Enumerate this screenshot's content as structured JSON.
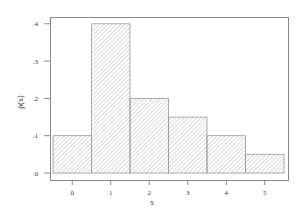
{
  "chart_data": {
    "type": "bar",
    "title": "",
    "xlabel": "x",
    "ylabel": "p(x)",
    "categories": [
      "0",
      "1",
      "2",
      "3",
      "4",
      "5"
    ],
    "values": [
      0.1,
      0.4,
      0.2,
      0.15,
      0.1,
      0.05
    ],
    "ylim": [
      0,
      0.43
    ],
    "yticks": [
      0,
      0.1,
      0.2,
      0.3,
      0.4
    ],
    "ytick_labels": [
      "0",
      ".1",
      ".2",
      ".3",
      ".4"
    ],
    "grid": false,
    "legend": null,
    "bar_style": "diagonal-hatch",
    "colors": {
      "frame": "#8a8a8a",
      "bar_edge": "#9a9a9a",
      "hatch": "#b5b5b5",
      "text": "#333333"
    }
  }
}
